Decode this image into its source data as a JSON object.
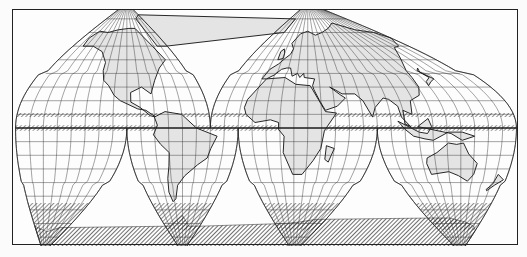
{
  "map": {
    "title": "Interrupted world map (Goode homolosine) with hatched zones",
    "projection": "interrupted-homolosine",
    "style": {
      "ink": "#222222",
      "land_fill": "#e4e4e4",
      "paper": "#fdfdfd",
      "hatch": "#333333"
    },
    "frame": {
      "x": 12,
      "y": 9,
      "width": 506,
      "height": 236
    },
    "lobes_north": [
      {
        "name": "north-america-lobe",
        "lon_min": -180,
        "lon_max": -40,
        "lon_center": -100
      },
      {
        "name": "eurasia-lobe",
        "lon_min": -40,
        "lon_max": 180,
        "lon_center": 30
      }
    ],
    "lobes_south": [
      {
        "name": "pacific-southeast-lobe",
        "lon_min": -180,
        "lon_max": -100,
        "lon_center": -160
      },
      {
        "name": "south-america-lobe",
        "lon_min": -100,
        "lon_max": -20,
        "lon_center": -60
      },
      {
        "name": "africa-lobe",
        "lon_min": -20,
        "lon_max": 80,
        "lon_center": 20
      },
      {
        "name": "australia-lobe",
        "lon_min": 80,
        "lon_max": 180,
        "lon_center": 140
      }
    ],
    "hatched_zones": [
      {
        "name": "equatorial-band-north",
        "lat_min": 8,
        "lat_max": 11
      },
      {
        "name": "equatorial-band-south",
        "lat_min": -2,
        "lat_max": 2
      },
      {
        "name": "antarctic-zone",
        "lat_min": -75,
        "lat_max": -55
      }
    ],
    "graticule_step_deg": 10,
    "labels": []
  }
}
